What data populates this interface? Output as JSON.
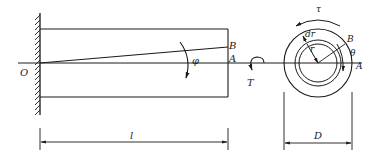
{
  "figure": {
    "type": "torsion-of-circular-shaft",
    "stroke_color": "#1a1a1a",
    "background": "#ffffff"
  },
  "side_view": {
    "origin_label": "O",
    "point_b_label": "B",
    "point_a_label": "A",
    "angle_label": "φ",
    "torque_label": "T",
    "length_label": "l"
  },
  "cross_section": {
    "stress_label": "τ",
    "dr_label": "dr",
    "r_label": "r",
    "point_b_label": "B",
    "angle_label": "θ",
    "point_a_label": "A",
    "diameter_label": "D"
  }
}
